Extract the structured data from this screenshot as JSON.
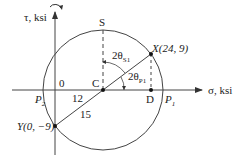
{
  "diagram": {
    "type": "Mohr's circle",
    "axes": {
      "horizontal_label": "σ, ksi",
      "vertical_label": "τ, ksi"
    },
    "points": {
      "X": {
        "label": "X(24, 9)",
        "sigma": 24,
        "tau": 9
      },
      "Y": {
        "label": "Y(0, −9)",
        "sigma": 0,
        "tau": -9
      },
      "C": {
        "label": "C",
        "sigma": 12,
        "tau": 0
      },
      "D": {
        "label": "D",
        "sigma": 24,
        "tau": 0
      },
      "S": {
        "label": "S"
      },
      "P1": {
        "label": "P",
        "sub": "1"
      },
      "P2": {
        "label": "P",
        "sub": "2"
      },
      "origin": {
        "label": "0"
      }
    },
    "dimensions": {
      "center_distance": "12",
      "radius": "15"
    },
    "angles": {
      "two_theta_s1": {
        "label": "2θ",
        "sub": "S1"
      },
      "two_theta_p1": {
        "label": "2θ",
        "sub": "P1"
      }
    }
  }
}
